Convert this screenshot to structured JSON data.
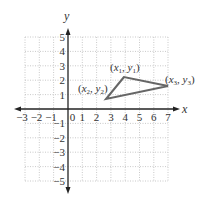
{
  "diagram": {
    "title": "",
    "x_axis": {
      "label": "x",
      "min": -3,
      "max": 7,
      "ticks": [
        "-3",
        "-2",
        "-1",
        "0",
        "1",
        "2",
        "3",
        "4",
        "5",
        "6",
        "7"
      ]
    },
    "y_axis": {
      "label": "y",
      "min": -5,
      "max": 5,
      "ticks": [
        "5",
        "4",
        "3",
        "2",
        "1",
        "-1",
        "-2",
        "-3",
        "-4",
        "-5"
      ]
    },
    "grid": {
      "style": "dotted",
      "color": "#bbbbbb"
    },
    "triangle": {
      "stroke": "#666666",
      "vertices": [
        {
          "name": "(x1, y1)",
          "x": 3.9,
          "y": 2.2,
          "sub": "1"
        },
        {
          "name": "(x2, y2)",
          "x": 2.7,
          "y": 0.7,
          "sub": "2"
        },
        {
          "name": "(x3, y3)",
          "x": 7.0,
          "y": 1.6,
          "sub": "3"
        }
      ]
    }
  }
}
